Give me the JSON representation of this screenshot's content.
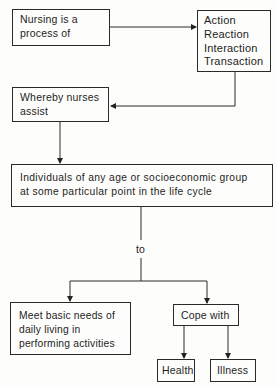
{
  "diagram": {
    "nodes": {
      "nursing": {
        "lines": [
          "Nursing is a",
          "process of"
        ]
      },
      "actions": {
        "lines": [
          "Action",
          "Reaction",
          "Interaction",
          "Transaction"
        ]
      },
      "assist": {
        "lines": [
          "Whereby nurses",
          "assist"
        ]
      },
      "individuals": {
        "lines": [
          "Individuals of any age or socioeconomic group",
          "at some particular point in the life cycle"
        ]
      },
      "needs": {
        "lines": [
          "Meet basic needs of",
          "daily living in",
          "performing activities"
        ]
      },
      "cope": {
        "lines": [
          "Cope with"
        ]
      },
      "health": {
        "lines": [
          "Health"
        ]
      },
      "illness": {
        "lines": [
          "Illness"
        ]
      }
    },
    "connector_label": "to",
    "edges": [
      {
        "from": "nursing",
        "to": "actions"
      },
      {
        "from": "actions",
        "to": "assist"
      },
      {
        "from": "assist",
        "to": "individuals"
      },
      {
        "from": "individuals",
        "to": "needs",
        "label": "to"
      },
      {
        "from": "individuals",
        "to": "cope",
        "label": "to"
      },
      {
        "from": "cope",
        "to": "health"
      },
      {
        "from": "cope",
        "to": "illness"
      }
    ]
  }
}
